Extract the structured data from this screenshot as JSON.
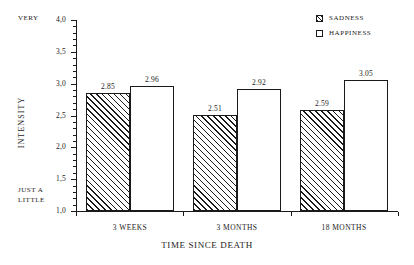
{
  "chart_data": {
    "type": "bar",
    "title": "",
    "xlabel": "TIME SINCE DEATH",
    "ylabel": "INTENSITY",
    "categories": [
      "3 WEEKS",
      "3 MONTHS",
      "18 MONTHS"
    ],
    "series": [
      {
        "name": "SADNESS",
        "values": [
          2.85,
          2.51,
          2.59
        ],
        "fill": "hatched"
      },
      {
        "name": "HAPPINESS",
        "values": [
          2.96,
          2.92,
          3.05
        ],
        "fill": "white"
      }
    ],
    "ylim": [
      1.0,
      4.0
    ],
    "ytick_labels": [
      "4,0",
      "3,5",
      "3,0",
      "2,5",
      "2,0",
      "1,5",
      "1,0"
    ],
    "ytick_values": [
      4.0,
      3.5,
      3.0,
      2.5,
      2.0,
      1.5,
      1.0
    ],
    "yminor_step": 0.1,
    "grid": false,
    "legend_position": "top-right",
    "scale_anchors": {
      "high": "VERY",
      "low_line1": "JUST A",
      "low_line2": "LITTLE"
    },
    "value_labels": [
      "2.85",
      "2.96",
      "2.51",
      "2.92",
      "2.59",
      "3.05"
    ],
    "colors": {
      "ink": "#1a1a1a",
      "background": "#ffffff",
      "bar_fill_happiness": "#ffffff",
      "bar_hatch_sadness": "#1a1a1a"
    }
  },
  "legend": {
    "items": [
      {
        "label": "SADNESS"
      },
      {
        "label": "HAPPINESS"
      }
    ]
  }
}
